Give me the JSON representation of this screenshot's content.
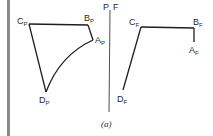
{
  "figure": {
    "caption": "(a)",
    "divider_label_left": "P",
    "divider_label_right": "F",
    "line_color": "#1e1e1e",
    "bar_color": "#8a8a8a"
  },
  "panel_p": {
    "vertices": [
      {
        "name": "C",
        "sub": "P",
        "x": 29,
        "y": 24
      },
      {
        "name": "B",
        "sub": "P",
        "x": 88,
        "y": 25
      },
      {
        "name": "A",
        "sub": "P",
        "x": 93,
        "y": 40
      },
      {
        "name": "D",
        "sub": "P",
        "x": 46,
        "y": 92
      }
    ],
    "edges": [
      "C-B straight",
      "B-A straight",
      "A-D curved",
      "D-C straight"
    ]
  },
  "panel_f": {
    "vertices": [
      {
        "name": "C",
        "sub": "F",
        "x": 141,
        "y": 27
      },
      {
        "name": "B",
        "sub": "F",
        "x": 194,
        "y": 28
      },
      {
        "name": "A",
        "sub": "F",
        "x": 194,
        "y": 42
      },
      {
        "name": "D",
        "sub": "F",
        "x": 123,
        "y": 90
      }
    ],
    "edges": [
      "C-B straight",
      "B-A straight",
      "C-D straight"
    ]
  }
}
